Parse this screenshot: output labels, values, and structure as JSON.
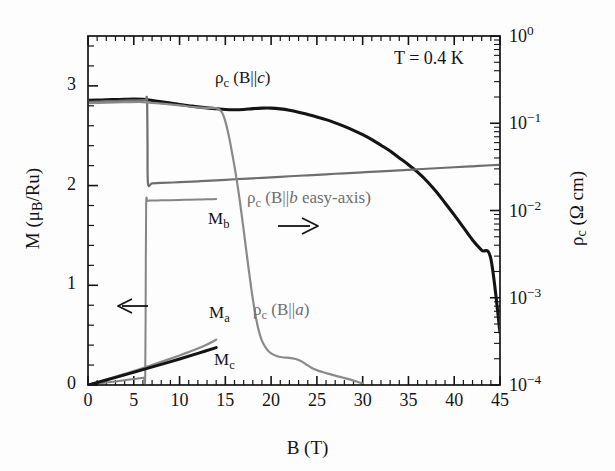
{
  "figure": {
    "annotation_temperature": "T = 0.4 K",
    "background": "#fdfdfd",
    "color_dark": "#141414",
    "color_gray": "#6e6e6e"
  },
  "axes": {
    "x": {
      "label_main": "B (T)",
      "min": 0,
      "max": 45,
      "ticks": [
        0,
        5,
        10,
        15,
        20,
        25,
        30,
        35,
        40,
        45
      ],
      "tick_labels": [
        "0",
        "5",
        "10",
        "15",
        "20",
        "25",
        "30",
        "35",
        "40",
        "45"
      ],
      "minor_step": 1
    },
    "y_left": {
      "label_prefix": "M (",
      "label_mu": "μ",
      "label_sub": "B",
      "label_suffix": "/Ru)",
      "label_plain": "M (μB/Ru)",
      "min": 0,
      "max": 3.5,
      "ticks": [
        0,
        1,
        2,
        3
      ],
      "tick_labels": [
        "0",
        "1",
        "2",
        "3"
      ],
      "minor_step": 0.2
    },
    "y_right": {
      "label_rho": "ρ",
      "label_sub": "c",
      "label_suffix": " (Ω cm)",
      "label_plain": "ρc (Ω cm)",
      "scale": "log",
      "min": 0.0001,
      "max": 1,
      "tick_labels": [
        "10⁰",
        "10⁻¹",
        "10⁻²",
        "10⁻³",
        "10⁻⁴"
      ],
      "tick_exponents": [
        0,
        -1,
        -2,
        -3,
        -4
      ]
    }
  },
  "curve_labels": {
    "rho_c_Bc": {
      "rho": "ρ",
      "sub": "c",
      "rest": " (B||",
      "ital": "c",
      "close": ")",
      "plain": "ρc (B||c)"
    },
    "rho_c_Bb": {
      "rho": "ρ",
      "sub": "c",
      "rest": " (B||",
      "ital": "b",
      "close": " easy-axis)",
      "plain": "ρc (B||b easy-axis)"
    },
    "rho_c_Ba": {
      "rho": "ρ",
      "sub": "c",
      "rest": " (B||",
      "ital": "a",
      "close": ")",
      "plain": "ρc (B||a)"
    },
    "M_b": {
      "main": "M",
      "sub": "b",
      "plain": "Mb"
    },
    "M_a": {
      "main": "M",
      "sub": "a",
      "plain": "Ma"
    },
    "M_c": {
      "main": "M",
      "sub": "c",
      "plain": "Mc"
    }
  },
  "arrows": {
    "left_arrow": "←",
    "right_arrow": "→"
  },
  "chart_data": {
    "type": "line",
    "title": "",
    "subtitle": "",
    "xlabel": "B (T)",
    "ylabel": "M (μB/Ru)",
    "ylabel_right": "ρc (Ω cm)",
    "xlim": [
      0,
      45
    ],
    "ylim_left": [
      0,
      3.5
    ],
    "ylim_right": [
      0.0001,
      1
    ],
    "yscale_right": "log",
    "grid": false,
    "legend": "inline-labels",
    "annotations": [
      {
        "text": "T = 0.4 K",
        "x": 38.5,
        "y_left": 3.25
      },
      {
        "text": "← (left axis)",
        "x": 4.0,
        "y_left": 0.78
      },
      {
        "text": "→ (right axis)",
        "x": 22.0,
        "y_left": 1.58
      }
    ],
    "series": [
      {
        "name": "ρc (B||c)",
        "axis": "right",
        "color": "#141414",
        "width": 3.1,
        "units": "Ω cm",
        "x": [
          0,
          1,
          2,
          3,
          4,
          5,
          6,
          6.5,
          7,
          8,
          9,
          10,
          11,
          12,
          13,
          14,
          15,
          16,
          17,
          18,
          19,
          20,
          21,
          22,
          23,
          24,
          25,
          26,
          27,
          28,
          29,
          30,
          31,
          32,
          33,
          34,
          35,
          36,
          37,
          38,
          39,
          40,
          41,
          42,
          43,
          44,
          45
        ],
        "y": [
          0.183,
          0.184,
          0.186,
          0.187,
          0.188,
          0.189,
          0.188,
          0.186,
          0.182,
          0.176,
          0.17,
          0.164,
          0.159,
          0.154,
          0.15,
          0.147,
          0.144,
          0.143,
          0.144,
          0.147,
          0.149,
          0.149,
          0.146,
          0.141,
          0.134,
          0.126,
          0.118,
          0.11,
          0.101,
          0.092,
          0.083,
          0.074,
          0.065,
          0.056,
          0.048,
          0.04,
          0.0335,
          0.0275,
          0.0218,
          0.0166,
          0.0122,
          0.0089,
          0.0064,
          0.0046,
          0.0035,
          0.0028,
          0.0004
        ]
      },
      {
        "name": "ρc (B||b easy-axis)",
        "axis": "right",
        "color": "#6e6e6e",
        "width": 2.2,
        "units": "Ω cm",
        "note": "sharp first-order drop at B = 6.5 T",
        "x": [
          0,
          1,
          2,
          3,
          4,
          5,
          6,
          6.3,
          6.45,
          6.5,
          6.55,
          7,
          8,
          10,
          12,
          14,
          16,
          18,
          20,
          22,
          24,
          26,
          28,
          30,
          32,
          34,
          36,
          38,
          40,
          42,
          44,
          45
        ],
        "y": [
          0.176,
          0.177,
          0.179,
          0.18,
          0.182,
          0.183,
          0.184,
          0.185,
          0.185,
          0.06,
          0.0205,
          0.0205,
          0.0207,
          0.0211,
          0.0216,
          0.0221,
          0.0228,
          0.0234,
          0.024,
          0.0247,
          0.0253,
          0.026,
          0.0267,
          0.0274,
          0.0281,
          0.0289,
          0.0297,
          0.0305,
          0.0313,
          0.0321,
          0.033,
          0.0334
        ]
      },
      {
        "name": "ρc (B||a)",
        "axis": "right",
        "color": "#8a8a8a",
        "width": 2.2,
        "units": "Ω cm",
        "note": "steep collapse near 17-19 T, shoulder near 23 T",
        "x": [
          0,
          2,
          4,
          6,
          8,
          10,
          12,
          13,
          14,
          14.6,
          15,
          15.4,
          15.8,
          16.2,
          16.6,
          17,
          17.4,
          17.8,
          18.2,
          18.6,
          19,
          19.5,
          20,
          20.6,
          21.2,
          22,
          22.6,
          23.2,
          23.8,
          24.4,
          25,
          25.6,
          26.2,
          27,
          27.8,
          28.6,
          29.3,
          30
        ],
        "y": [
          0.17,
          0.172,
          0.174,
          0.175,
          0.168,
          0.16,
          0.152,
          0.15,
          0.149,
          0.135,
          0.105,
          0.07,
          0.042,
          0.024,
          0.0125,
          0.006,
          0.0028,
          0.00135,
          0.00072,
          0.00044,
          0.00032,
          0.00026,
          0.00023,
          0.000215,
          0.000208,
          0.000205,
          0.0002,
          0.00019,
          0.000173,
          0.000158,
          0.000148,
          0.000141,
          0.000135,
          0.000128,
          0.000122,
          0.000116,
          0.00011,
          0.000104
        ]
      },
      {
        "name": "Mb",
        "axis": "left",
        "color": "#858585",
        "width": 2.0,
        "units": "μB/Ru",
        "note": "metamagnetic jump at 6.3 T to saturation plateau 1.85",
        "x": [
          0,
          1,
          2,
          3,
          4,
          5,
          5.8,
          6.1,
          6.25,
          6.3,
          6.35,
          6.5,
          7,
          8,
          9,
          10,
          11,
          12,
          13,
          13.7,
          14
        ],
        "y": [
          0.0,
          0.012,
          0.024,
          0.036,
          0.048,
          0.06,
          0.07,
          0.074,
          0.076,
          0.9,
          1.8,
          1.845,
          1.85,
          1.852,
          1.854,
          1.856,
          1.858,
          1.86,
          1.862,
          1.864,
          1.865
        ]
      },
      {
        "name": "Ma",
        "axis": "left",
        "color": "#8a8a8a",
        "width": 2.2,
        "units": "μB/Ru",
        "x": [
          0,
          2,
          4,
          6,
          8,
          10,
          11,
          12,
          13,
          13.6,
          14
        ],
        "y": [
          0.0,
          0.055,
          0.112,
          0.17,
          0.232,
          0.296,
          0.33,
          0.366,
          0.406,
          0.434,
          0.455
        ]
      },
      {
        "name": "Mc",
        "axis": "left",
        "color": "#141414",
        "width": 3.0,
        "units": "μB/Ru",
        "x": [
          0,
          2,
          4,
          6,
          8,
          10,
          12,
          14
        ],
        "y": [
          0.0,
          0.05,
          0.102,
          0.154,
          0.207,
          0.261,
          0.317,
          0.375
        ]
      }
    ]
  }
}
